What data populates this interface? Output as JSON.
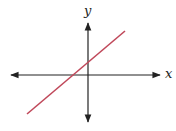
{
  "figure": {
    "type": "coordinate-plane-line",
    "axes": {
      "x_label": "x",
      "y_label": "y",
      "color": "#222222"
    },
    "line": {
      "description": "straight line with positive slope, positive y-intercept, negative x-intercept",
      "color": "#c0485a",
      "start": [
        27,
        114
      ],
      "end": [
        125,
        31
      ]
    }
  }
}
